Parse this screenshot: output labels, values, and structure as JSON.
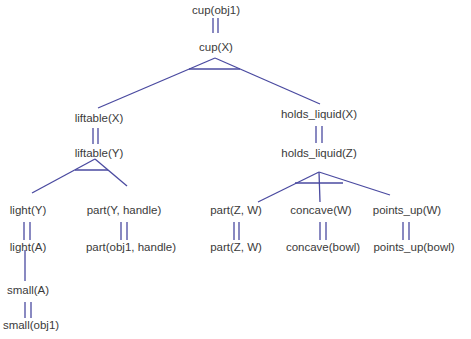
{
  "diagram": {
    "type": "explanation-tree",
    "line_color": "#4a4aa0",
    "text_color": "#3a3a3a",
    "nodes": {
      "n1": "cup(obj1)",
      "n2": "cup(X)",
      "n3": "liftable(X)",
      "n4": "liftable(Y)",
      "n5": "holds_liquid(X)",
      "n6": "holds_liquid(Z)",
      "n7": "light(Y)",
      "n8": "light(A)",
      "n9": "small(A)",
      "n10": "small(obj1)",
      "n11": "part(Y, handle)",
      "n12": "part(obj1, handle)",
      "n13": "part(Z, W)",
      "n14": "part(Z, W)",
      "n15": "concave(W)",
      "n16": "concave(bowl)",
      "n17": "points_up(W)",
      "n18": "points_up(bowl)"
    },
    "edges": [
      {
        "from": "cup(obj1)",
        "to": "cup(X)",
        "kind": "unification"
      },
      {
        "from": "cup(X)",
        "to": "liftable(X)",
        "kind": "rule-and"
      },
      {
        "from": "cup(X)",
        "to": "holds_liquid(X)",
        "kind": "rule-and"
      },
      {
        "from": "liftable(X)",
        "to": "liftable(Y)",
        "kind": "unification"
      },
      {
        "from": "holds_liquid(X)",
        "to": "holds_liquid(Z)",
        "kind": "unification"
      },
      {
        "from": "liftable(Y)",
        "to": "light(Y)",
        "kind": "rule-and"
      },
      {
        "from": "liftable(Y)",
        "to": "part(Y, handle)",
        "kind": "rule-and"
      },
      {
        "from": "light(Y)",
        "to": "light(A)",
        "kind": "unification"
      },
      {
        "from": "light(A)",
        "to": "small(A)",
        "kind": "rule"
      },
      {
        "from": "small(A)",
        "to": "small(obj1)",
        "kind": "unification"
      },
      {
        "from": "part(Y, handle)",
        "to": "part(obj1, handle)",
        "kind": "unification"
      },
      {
        "from": "holds_liquid(Z)",
        "to": "part(Z, W)",
        "kind": "rule-and"
      },
      {
        "from": "holds_liquid(Z)",
        "to": "concave(W)",
        "kind": "rule-and"
      },
      {
        "from": "holds_liquid(Z)",
        "to": "points_up(W)",
        "kind": "rule-and"
      },
      {
        "from": "part(Z, W)",
        "to": "part(Z, W)",
        "kind": "unification"
      },
      {
        "from": "concave(W)",
        "to": "concave(bowl)",
        "kind": "unification"
      },
      {
        "from": "points_up(W)",
        "to": "points_up(bowl)",
        "kind": "unification"
      }
    ]
  }
}
